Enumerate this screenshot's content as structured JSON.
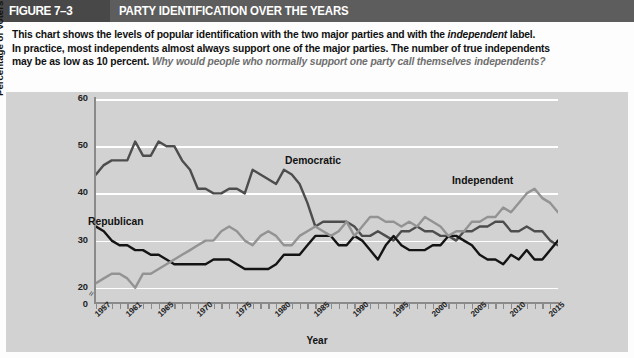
{
  "header": {
    "figure_number": "FIGURE 7–3",
    "title": "PARTY IDENTIFICATION OVER THE YEARS"
  },
  "caption": {
    "line1_a": "This chart shows the levels of popular identification with the two major parties and with the ",
    "line1_i": "independent",
    "line1_b": " label.",
    "line2": "In practice, most independents almost always support one of the major parties. The number of true independents",
    "line3_a": "may be as low as 10 percent. ",
    "line3_q": "Why would people who normally support one party call themselves independents?"
  },
  "colors": {
    "header_figure_bg": "#484848",
    "header_title_bg": "#5d5d5d",
    "panel_bg": "#d2d2d2",
    "gridline": "#ffffff",
    "axis": "#8a8a8a",
    "democratic": "#4d4d4d",
    "republican": "#141414",
    "independent": "#939393"
  },
  "chart_data": {
    "type": "line",
    "title": "Party Identification Over the Years",
    "xlabel": "Year",
    "ylabel": "Percentage of Voters",
    "xlim": [
      1957,
      2016
    ],
    "ylim": [
      17,
      60
    ],
    "yticks": [
      0,
      20,
      30,
      40,
      50,
      60
    ],
    "grid": true,
    "axis_break": true,
    "legend_position": "inline-labels",
    "xticks": [
      1957,
      1961,
      1965,
      1970,
      1975,
      1980,
      1985,
      1990,
      1995,
      2000,
      2005,
      2010,
      2015
    ],
    "x": [
      1957,
      1958,
      1959,
      1960,
      1961,
      1962,
      1963,
      1964,
      1965,
      1966,
      1967,
      1968,
      1969,
      1970,
      1971,
      1972,
      1973,
      1974,
      1975,
      1976,
      1977,
      1978,
      1979,
      1980,
      1981,
      1982,
      1983,
      1984,
      1985,
      1986,
      1987,
      1988,
      1989,
      1990,
      1991,
      1992,
      1993,
      1994,
      1995,
      1996,
      1997,
      1998,
      1999,
      2000,
      2001,
      2002,
      2003,
      2004,
      2005,
      2006,
      2007,
      2008,
      2009,
      2010,
      2011,
      2012,
      2013,
      2014,
      2015,
      2016
    ],
    "series": [
      {
        "name": "Democratic",
        "color": "#4d4d4d",
        "values": [
          44,
          46,
          47,
          47,
          47,
          51,
          48,
          48,
          51,
          50,
          50,
          47,
          45,
          41,
          41,
          40,
          40,
          41,
          41,
          40,
          45,
          44,
          43,
          42,
          45,
          44,
          42,
          38,
          33,
          34,
          34,
          34,
          34,
          33,
          31,
          31,
          32,
          31,
          30,
          32,
          32,
          33,
          32,
          32,
          31,
          31,
          30,
          32,
          32,
          33,
          33,
          34,
          34,
          32,
          32,
          33,
          32,
          32,
          30,
          29
        ]
      },
      {
        "name": "Republican",
        "color": "#141414",
        "values": [
          33,
          32,
          30,
          29,
          29,
          28,
          28,
          27,
          27,
          26,
          25,
          25,
          25,
          25,
          25,
          26,
          26,
          26,
          25,
          24,
          24,
          24,
          24,
          25,
          27,
          27,
          27,
          29,
          31,
          31,
          31,
          29,
          29,
          31,
          30,
          28,
          26,
          29,
          31,
          29,
          28,
          28,
          28,
          29,
          29,
          31,
          31,
          30,
          29,
          27,
          26,
          26,
          25,
          27,
          26,
          28,
          26,
          26,
          28,
          30
        ]
      },
      {
        "name": "Independent",
        "color": "#939393",
        "values": [
          21,
          22,
          23,
          23,
          22,
          20,
          23,
          23,
          24,
          25,
          26,
          27,
          28,
          29,
          30,
          30,
          32,
          33,
          32,
          30,
          29,
          31,
          32,
          31,
          29,
          29,
          31,
          32,
          33,
          32,
          31,
          32,
          34,
          31,
          33,
          35,
          35,
          34,
          34,
          33,
          34,
          33,
          35,
          34,
          33,
          31,
          32,
          32,
          34,
          34,
          35,
          35,
          37,
          36,
          38,
          40,
          41,
          39,
          38,
          36
        ]
      }
    ]
  },
  "series_labels": [
    {
      "name": "Democratic",
      "x": 285,
      "y": 155
    },
    {
      "name": "Republican",
      "x": 88,
      "y": 216
    },
    {
      "name": "Independent",
      "x": 452,
      "y": 175
    }
  ]
}
